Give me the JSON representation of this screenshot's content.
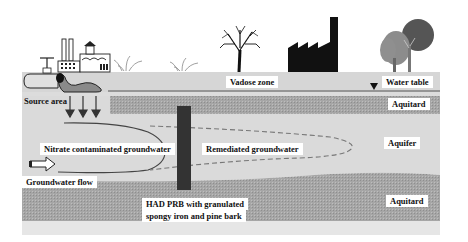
{
  "diagram": {
    "type": "cross-section",
    "colors": {
      "vadose": "#d4d4d4",
      "aquitard": "#a8a8a8",
      "aquifer": "#d9d9d9",
      "barrier": "#3a3a3a",
      "plume_line": "#555555",
      "dashed_line": "#7a7a7a",
      "background": "#ffffff"
    },
    "surface_icons": [
      {
        "name": "factory-with-pipe",
        "x": 30
      },
      {
        "name": "grass",
        "x": 135
      },
      {
        "name": "grass",
        "x": 185
      },
      {
        "name": "bare-tree",
        "x": 240
      },
      {
        "name": "factory-silhouette",
        "x": 290
      },
      {
        "name": "deciduous-trees",
        "x": 430
      }
    ],
    "labels": {
      "source_area": "Source area",
      "vadose_zone": "Vadose zone",
      "water_table": "Water table",
      "aquitard_top": "Aquitard",
      "aquifer": "Aquifer",
      "aquitard_bottom": "Aquitard",
      "nitrate_groundwater": "Nitrate contaminated groundwater",
      "remediated_groundwater": "Remediated groundwater",
      "groundwater_flow": "Groundwater flow",
      "prb_line1": "HAD PRB with granulated",
      "prb_line2": "spongy iron and pine bark"
    },
    "symbols": {
      "water_table_marker": "▼",
      "flow_arrow": "⇨"
    }
  }
}
